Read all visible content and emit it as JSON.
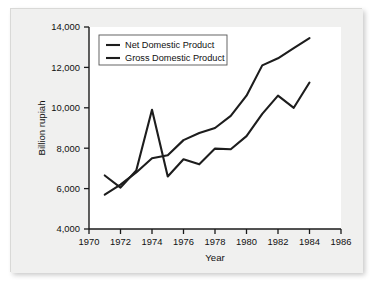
{
  "chart_data": {
    "type": "line",
    "title": "",
    "xlabel": "Year",
    "ylabel": "Billion rupiah",
    "xlim": [
      1970,
      1986
    ],
    "ylim": [
      4000,
      14000
    ],
    "xticks": [
      1970,
      1972,
      1974,
      1976,
      1978,
      1980,
      1982,
      1984,
      1986
    ],
    "xtick_labels": [
      "1970",
      "1972",
      "1974",
      "1976",
      "1978",
      "1980",
      "1982",
      "1984",
      "1986"
    ],
    "yticks": [
      4000,
      6000,
      8000,
      10000,
      12000,
      14000
    ],
    "ytick_labels": [
      "4,000",
      "6,000",
      "8,000",
      "10,000",
      "12,000",
      "14,000"
    ],
    "grid": false,
    "legend_position": "upper left",
    "x": [
      1971,
      1972,
      1973,
      1974,
      1975,
      1976,
      1977,
      1978,
      1979,
      1980,
      1981,
      1982,
      1983,
      1984
    ],
    "series": [
      {
        "name": "Net Domestic Product",
        "color": "#1d1d1d",
        "values": [
          6650,
          6050,
          6900,
          9900,
          6600,
          7450,
          7200,
          7980,
          7950,
          8600,
          9700,
          10600,
          10000,
          11250
        ]
      },
      {
        "name": "Gross Domestic Product",
        "color": "#1d1d1d",
        "values": [
          5700,
          6200,
          6800,
          7500,
          7650,
          8400,
          8750,
          9000,
          9600,
          10600,
          12100,
          12450,
          12950,
          13450
        ]
      }
    ]
  },
  "legend": {
    "entries": [
      {
        "label": "Net Domestic Product"
      },
      {
        "label": "Gross Domestic Product"
      }
    ]
  },
  "axes": {
    "y_title": "Billion rupiah",
    "x_title": "Year"
  }
}
